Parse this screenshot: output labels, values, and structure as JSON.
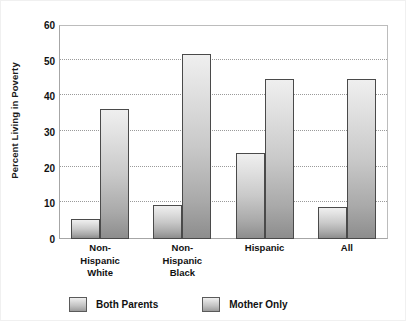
{
  "chart_data": {
    "type": "bar",
    "title": "",
    "xlabel": "",
    "ylabel": "Percent Living in Poverty",
    "ylim": [
      0,
      60
    ],
    "yticks": [
      0,
      10,
      20,
      30,
      40,
      50,
      60
    ],
    "ytick_labels": [
      "0",
      "10",
      "20",
      "30",
      "40",
      "50",
      "60"
    ],
    "grid": true,
    "legend_position": "bottom",
    "categories": [
      {
        "label": "Non-Hispanic White",
        "lines": [
          "Non-",
          "Hispanic",
          "White"
        ]
      },
      {
        "label": "Non-Hispanic Black",
        "lines": [
          "Non-",
          "Hispanic",
          "Black"
        ]
      },
      {
        "label": "Hispanic",
        "lines": [
          "Hispanic"
        ]
      },
      {
        "label": "All",
        "lines": [
          "All"
        ]
      }
    ],
    "series": [
      {
        "name": "Both Parents",
        "values": [
          5.5,
          9.5,
          24,
          9
        ]
      },
      {
        "name": "Mother Only",
        "values": [
          36.5,
          52,
          45,
          45
        ]
      }
    ],
    "colors": {
      "bar_top": "#efefef",
      "bar_bottom": "#8d8d8d",
      "bar_border": "#4a4a4a",
      "gridline": "#9a9a9a",
      "axis": "#a6a6a6",
      "text": "#111111",
      "background": "#ffffff"
    }
  }
}
